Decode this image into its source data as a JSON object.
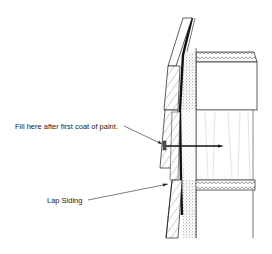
{
  "figure": {
    "annotations": [
      {
        "id": "fill",
        "text": "Fill here after first coat of paint."
      },
      {
        "id": "lap",
        "text": "Lap Siding"
      }
    ]
  },
  "colors": {
    "line": "#1a1a1a",
    "stipple": "#555555",
    "paper": "#ffffff"
  }
}
